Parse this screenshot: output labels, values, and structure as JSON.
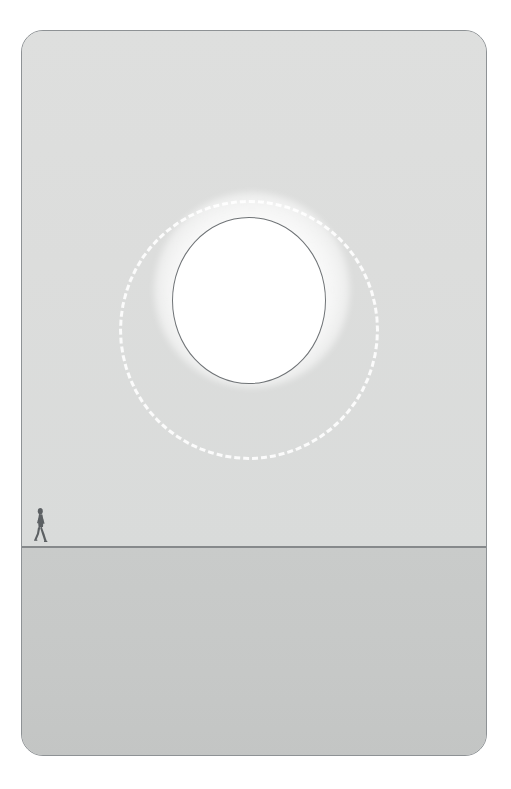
{
  "scene": {
    "title": "Eclipse Horizon",
    "description": "Minimal grey landscape illustration: a large white glowing disc encircled by a dashed orbit ring hovers above a flat horizon, with a single tiny walking human silhouette at the far left for scale.",
    "panel": {
      "border_color": "#8e9295",
      "corner_radius": "22px"
    },
    "sky": {
      "label": "sky",
      "color_top": "#dedfde",
      "color_bottom": "#d9dbda"
    },
    "ground": {
      "label": "ground",
      "color_top": "#c9cbca",
      "color_bottom": "#c3c5c4"
    },
    "horizon": {
      "label": "horizon line",
      "color": "#86898b"
    },
    "disc": {
      "label": "white disc",
      "fill": "#ffffff",
      "outline": "#6f7376"
    },
    "glow": {
      "label": "glow halo",
      "color": "#ffffff"
    },
    "orbit_ring": {
      "label": "dashed orbit ring",
      "color": "#fdfdfd",
      "style": "dashed"
    },
    "figure": {
      "label": "walking person silhouette",
      "color": "#5c6063"
    }
  }
}
